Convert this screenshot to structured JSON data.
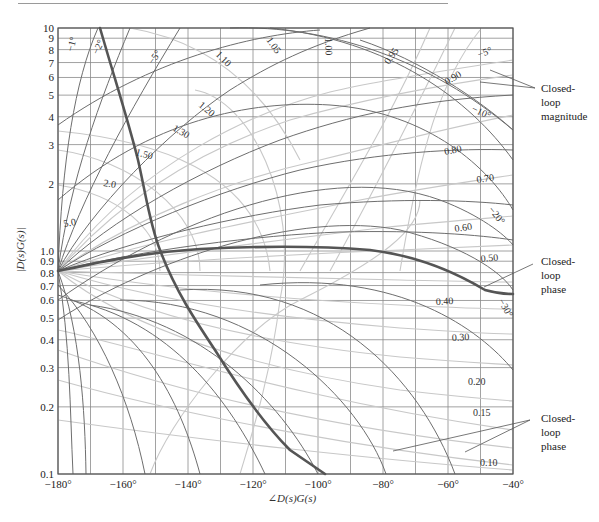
{
  "chart_data": {
    "type": "line",
    "title": "",
    "xlabel": "∠D(s)G(s)",
    "ylabel": "|D(s)G(s)|",
    "xlim": [
      -180,
      -40
    ],
    "ylim": [
      0.1,
      10
    ],
    "yscale": "log",
    "grid": true,
    "x_ticks": [
      {
        "value": -180,
        "label": "−180°"
      },
      {
        "value": -160,
        "label": "−160°"
      },
      {
        "value": -140,
        "label": "−140°"
      },
      {
        "value": -120,
        "label": "−120°"
      },
      {
        "value": -100,
        "label": "−100°"
      },
      {
        "value": -80,
        "label": "−80°"
      },
      {
        "value": -60,
        "label": "−60°"
      },
      {
        "value": -40,
        "label": "−40°"
      }
    ],
    "y_ticks": [
      {
        "value": 10,
        "label": "10"
      },
      {
        "value": 9,
        "label": "9"
      },
      {
        "value": 8,
        "label": "8"
      },
      {
        "value": 7,
        "label": "7"
      },
      {
        "value": 6,
        "label": "6"
      },
      {
        "value": 5,
        "label": "5"
      },
      {
        "value": 4,
        "label": "4"
      },
      {
        "value": 3,
        "label": "3"
      },
      {
        "value": 2,
        "label": "2"
      },
      {
        "value": 1.0,
        "label": "1.0"
      },
      {
        "value": 0.9,
        "label": "0.9"
      },
      {
        "value": 0.8,
        "label": "0.8"
      },
      {
        "value": 0.7,
        "label": "0.7"
      },
      {
        "value": 0.6,
        "label": "0.6"
      },
      {
        "value": 0.5,
        "label": "0.5"
      },
      {
        "value": 0.4,
        "label": "0.4"
      },
      {
        "value": 0.3,
        "label": "0.3"
      },
      {
        "value": 0.2,
        "label": "0.2"
      },
      {
        "value": 0.1,
        "label": "0.1"
      }
    ],
    "closed_loop_magnitude_contours": [
      "5.0",
      "2.0",
      "1.50",
      "1.30",
      "1.20",
      "1.10",
      "1.05",
      "1.00",
      "0.95",
      "0.90",
      "0.80",
      "0.70",
      "0.60",
      "0.50",
      "0.40",
      "0.30",
      "0.20",
      "0.15",
      "0.10"
    ],
    "closed_loop_phase_contours": [
      "−1°",
      "−2°",
      "−5°",
      "−5°",
      "−10°",
      "−20°",
      "−30°"
    ],
    "series": [
      {
        "name": "open-loop response A (steep)",
        "points": [
          [
            -167,
            10
          ],
          [
            -155,
            2.6
          ],
          [
            -148,
            1.5
          ],
          [
            -140,
            0.95
          ],
          [
            -133,
            0.7
          ],
          [
            -120,
            0.35
          ],
          [
            -110,
            0.2
          ],
          [
            -97,
            0.1
          ]
        ]
      },
      {
        "name": "open-loop response B (flat)",
        "points": [
          [
            -180,
            0.8
          ],
          [
            -155,
            0.92
          ],
          [
            -140,
            0.97
          ],
          [
            -120,
            1.0
          ],
          [
            -100,
            1.0
          ],
          [
            -80,
            0.93
          ],
          [
            -60,
            0.72
          ],
          [
            -48,
            0.66
          ],
          [
            -40,
            0.65
          ]
        ]
      }
    ],
    "annotations": [
      {
        "text": "Closed-loop magnitude",
        "target": "magnitude contours near top right"
      },
      {
        "text": "Closed-loop phase",
        "target": "phase contour near -45°, 0.6"
      },
      {
        "text": "Closed-loop phase",
        "target": "phase contours near -75°/-55°, 0.12"
      }
    ]
  },
  "labels": {
    "ylabel": "|D(s)G(s)|",
    "xlabel": "∠D(s)G(s)",
    "ann_mag_line1": "Closed-",
    "ann_mag_line2": "loop",
    "ann_mag_line3": "magnitude",
    "ann_phase1_line1": "Closed-",
    "ann_phase1_line2": "loop",
    "ann_phase1_line3": "phase",
    "ann_phase2_line1": "Closed-",
    "ann_phase2_line2": "loop",
    "ann_phase2_line3": "phase",
    "m_5_0": "5.0",
    "m_2_0": "2.0",
    "m_1_50": "1.50",
    "m_1_30": "1.30",
    "m_1_20": "1.20",
    "m_1_10": "1.10",
    "m_1_05": "1.05",
    "m_1_00": "1.00",
    "m_0_95": "0.95",
    "m_0_90": "0.90",
    "m_0_80": "0.80",
    "m_0_70": "0.70",
    "m_0_60": "0.60",
    "m_0_50": "0.50",
    "m_0_40": "0.40",
    "m_0_30": "0.30",
    "m_0_20": "0.20",
    "m_0_15": "0.15",
    "m_0_10": "0.10",
    "p_1": "−1°",
    "p_2": "−2°",
    "p_5a": "−5°",
    "p_5b": "−5°",
    "p_10": "−10°",
    "p_20": "−20°",
    "p_30": "−30°"
  },
  "colors": {
    "frame": "#555555",
    "grid": "#8a8a8a",
    "contour_dark": "#6a6a6a",
    "contour_light": "#c4c4c4",
    "thick_curve": "#555555"
  }
}
